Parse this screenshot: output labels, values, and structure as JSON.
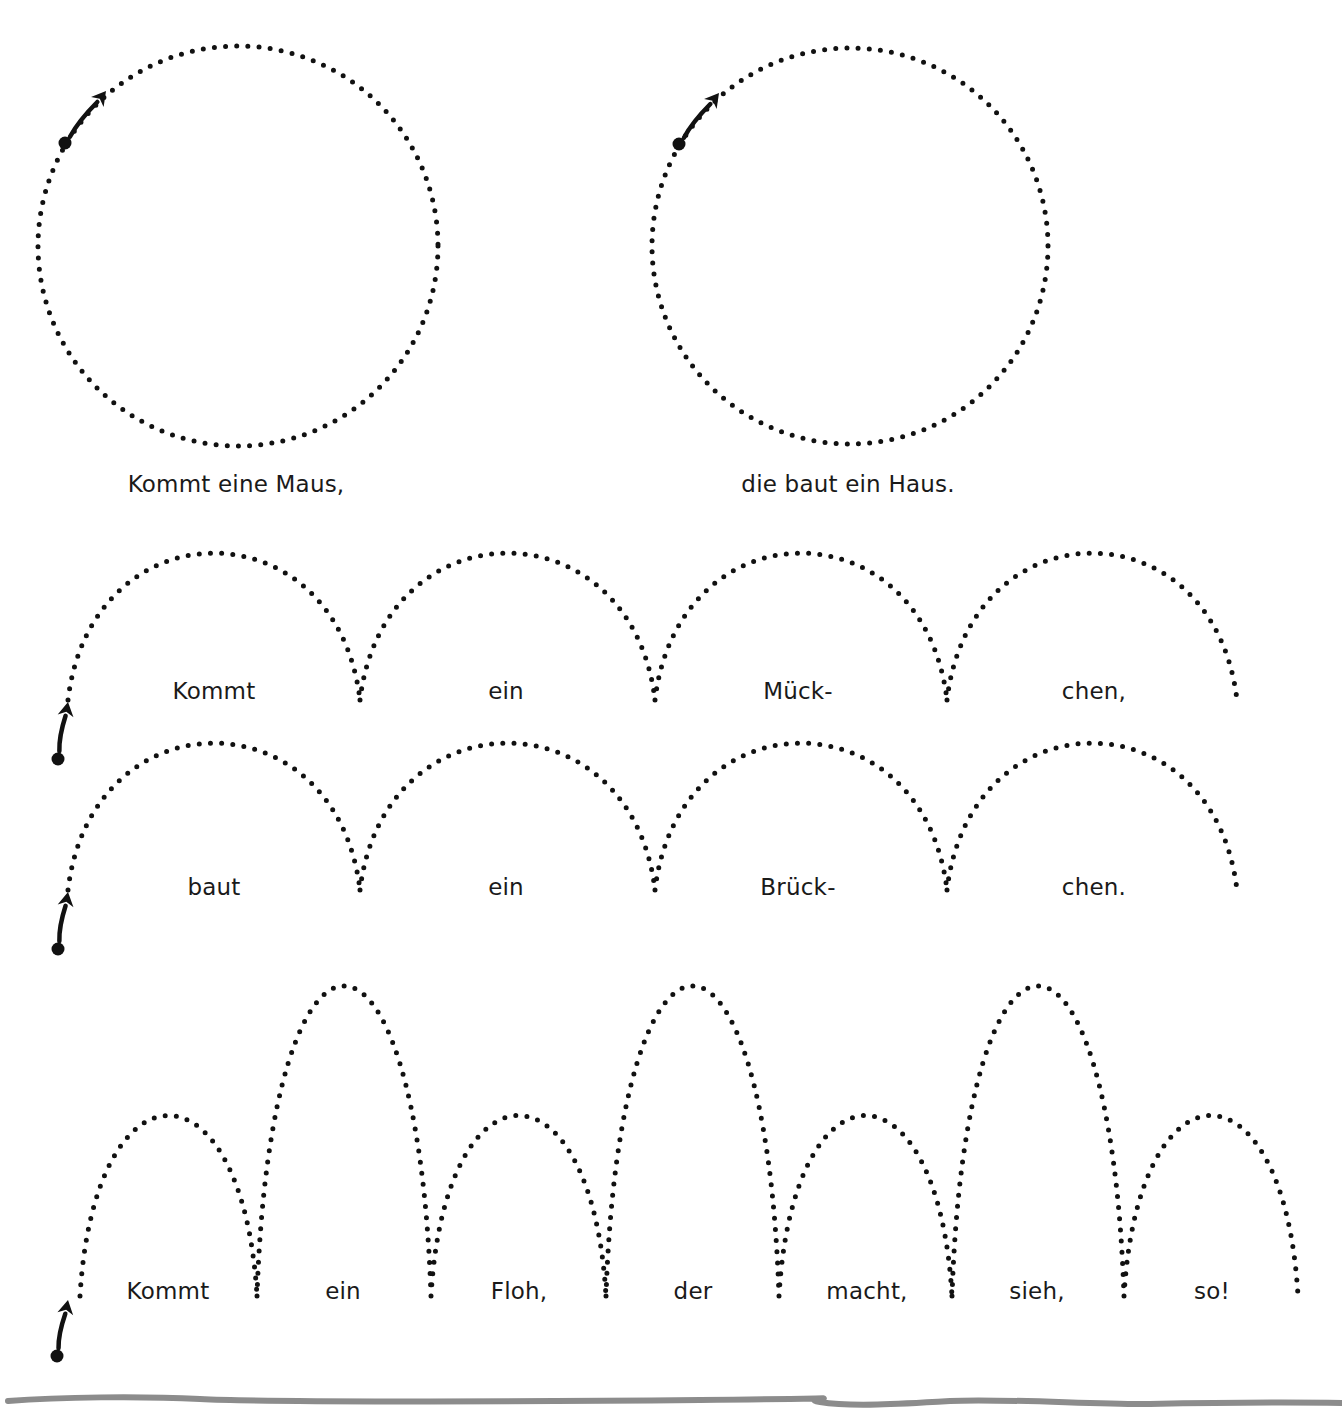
{
  "worksheet": {
    "type": "handwriting tracing exercise",
    "ink_color": "#111111",
    "rule_color": "#8c8c8c",
    "circles": [
      {
        "caption": "Kommt eine Maus,",
        "cx": 238,
        "cy": 246,
        "r": 200,
        "start": [
          65,
          143
        ],
        "arrow_tip": [
          106,
          91
        ]
      },
      {
        "caption": "die baut ein Haus.",
        "cx": 850,
        "cy": 246,
        "r": 198,
        "start": [
          679,
          144
        ],
        "arrow_tip": [
          719,
          93
        ]
      }
    ],
    "arch_rows": [
      {
        "baseline": 700,
        "peak": 547,
        "joins": [
          68,
          360,
          655,
          947,
          1237
        ],
        "words": [
          "Kommt",
          "ein",
          "Mück-",
          "chen,"
        ],
        "start": [
          58,
          759
        ],
        "arrow_tip": [
          68,
          702
        ]
      },
      {
        "baseline": 890,
        "peak": 737,
        "joins": [
          68,
          360,
          655,
          947,
          1237
        ],
        "words": [
          "baut",
          "ein",
          "Brück-",
          "chen."
        ],
        "start": [
          58,
          949
        ],
        "arrow_tip": [
          68,
          892
        ]
      }
    ],
    "flea_row": {
      "baseline": 1296,
      "short_peak": 1108,
      "tall_peak": 973,
      "joins": [
        80,
        257,
        431,
        606,
        779,
        952,
        1124,
        1298
      ],
      "pattern": [
        "short",
        "tall",
        "short",
        "tall",
        "short",
        "tall",
        "short"
      ],
      "words": [
        "Kommt",
        "ein",
        "Floh,",
        "der",
        "macht,",
        "sieh,",
        "so!"
      ],
      "start": [
        57,
        1356
      ],
      "arrow_tip": [
        68,
        1300
      ]
    }
  }
}
